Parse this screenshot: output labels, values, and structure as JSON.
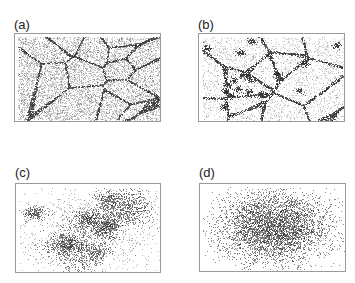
{
  "figure": {
    "panels": [
      {
        "id": "a",
        "label": "(a)",
        "pattern": "cellular-network",
        "description": "dense point field forming polygonal cells with dark boundary lines",
        "label_pos": [
          14,
          18
        ],
        "frame": [
          14,
          33,
          147,
          89
        ],
        "params": {
          "cells": 16,
          "points": 6500,
          "boundary_points": 2600,
          "color": "#3a3a3a"
        }
      },
      {
        "id": "b",
        "label": "(b)",
        "pattern": "network-with-clusters",
        "description": "sparser cellular network with dark clusters at junctions",
        "label_pos": [
          198,
          18
        ],
        "frame": [
          198,
          33,
          147,
          89
        ],
        "params": {
          "cells": 14,
          "points": 2600,
          "boundary_points": 2200,
          "color": "#2e2e2e"
        }
      },
      {
        "id": "c",
        "label": "(c)",
        "pattern": "diffuse-clusters",
        "description": "patchy clusters of points spread across panel",
        "label_pos": [
          15,
          166
        ],
        "frame": [
          15,
          183,
          146,
          90
        ],
        "params": {
          "clusters": 14,
          "points": 3800,
          "color": "#333333"
        }
      },
      {
        "id": "d",
        "label": "(d)",
        "pattern": "single-blob",
        "description": "one broad diffuse elliptical cloud centered in panel",
        "label_pos": [
          199,
          166
        ],
        "frame": [
          199,
          183,
          147,
          89
        ],
        "params": {
          "points": 4200,
          "color": "#2a2a2a"
        }
      }
    ]
  }
}
